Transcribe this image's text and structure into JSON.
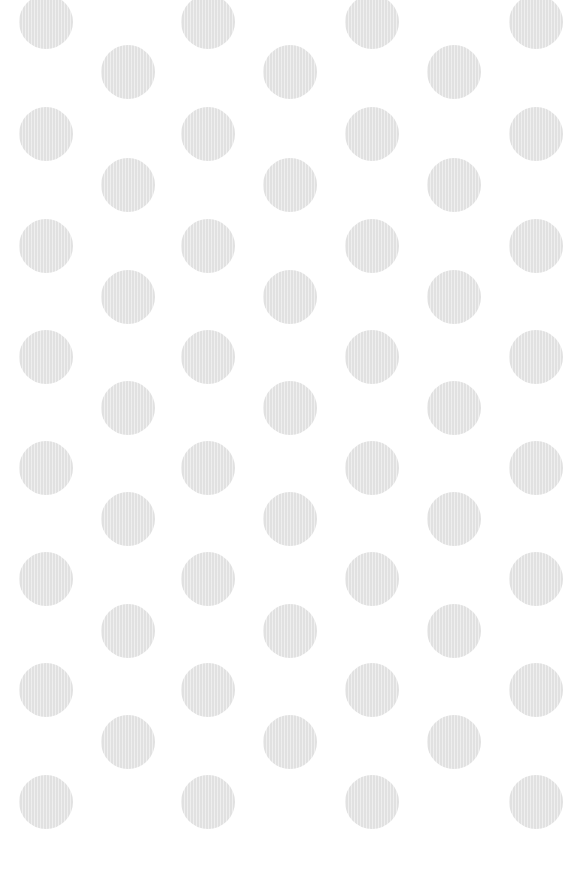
{
  "pattern": {
    "name": "polka-dot",
    "background_color": "#ffffff",
    "dot_color": "#e6e6e6",
    "dot_radius": 27,
    "columns_a_x": [
      46,
      208,
      372,
      536
    ],
    "columns_a_y": [
      22,
      134,
      246,
      357,
      468,
      579,
      690,
      802
    ],
    "columns_b_x": [
      128,
      290,
      454
    ],
    "columns_b_y": [
      72,
      185,
      297,
      408,
      519,
      631,
      742
    ]
  }
}
